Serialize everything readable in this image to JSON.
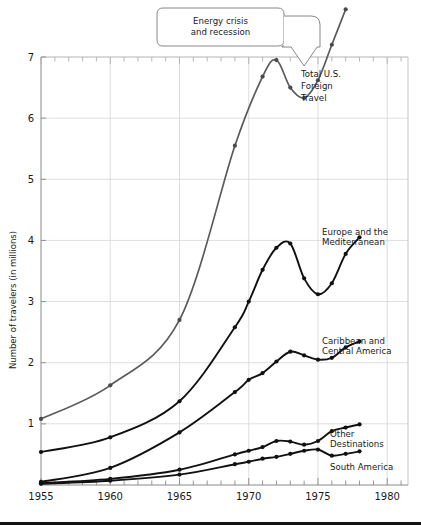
{
  "chart_data": {
    "type": "line",
    "title": "",
    "xlabel": "",
    "ylabel": "Number of travelers (in millions)",
    "xlim": [
      1955,
      1981.5
    ],
    "ylim": [
      0,
      7.85
    ],
    "grid": true,
    "legend_position": "right-inline-labels",
    "x_ticks_major": [
      1955,
      1960,
      1965,
      1970,
      1975,
      1980
    ],
    "x_tick_labels": [
      "1955",
      "1960",
      "1965",
      "1970",
      "1975",
      "1980"
    ],
    "x_minor_tick_step": 1,
    "y_ticks_major": [
      1,
      2,
      3,
      4,
      5,
      6,
      7
    ],
    "y_tick_labels": [
      "1",
      "2",
      "3",
      "4",
      "5",
      "6",
      "7"
    ],
    "annotations": [
      {
        "name": "energy-crisis-callout",
        "text_line1": "Energy crisis",
        "text_line2": "and recession",
        "points_to_year": 1974,
        "points_to_value": 6.85
      }
    ],
    "series": [
      {
        "name": "Total U.S. Foreign Travel",
        "label_line1": "Total U.S.",
        "label_line2": "Foreign",
        "label_line3": "Travel",
        "color": "#5a5a5a",
        "marker_color": "#4a4a4a",
        "points": [
          {
            "x": 1955,
            "y": 1.08
          },
          {
            "x": 1960,
            "y": 1.63
          },
          {
            "x": 1965,
            "y": 2.7
          },
          {
            "x": 1969,
            "y": 5.55
          },
          {
            "x": 1971,
            "y": 6.68
          },
          {
            "x": 1972,
            "y": 6.95
          },
          {
            "x": 1973,
            "y": 6.5
          },
          {
            "x": 1974,
            "y": 6.33
          },
          {
            "x": 1975,
            "y": 6.62
          },
          {
            "x": 1976,
            "y": 7.2
          },
          {
            "x": 1977,
            "y": 7.78
          }
        ]
      },
      {
        "name": "Europe and the Mediterranean",
        "label_line1": "Europe and the",
        "label_line2": "Mediterranean",
        "color": "#111111",
        "marker_color": "#111111",
        "points": [
          {
            "x": 1955,
            "y": 0.54
          },
          {
            "x": 1960,
            "y": 0.78
          },
          {
            "x": 1965,
            "y": 1.37
          },
          {
            "x": 1969,
            "y": 2.58
          },
          {
            "x": 1970,
            "y": 3.0
          },
          {
            "x": 1971,
            "y": 3.52
          },
          {
            "x": 1972,
            "y": 3.88
          },
          {
            "x": 1973,
            "y": 3.95
          },
          {
            "x": 1974,
            "y": 3.38
          },
          {
            "x": 1975,
            "y": 3.12
          },
          {
            "x": 1976,
            "y": 3.3
          },
          {
            "x": 1977,
            "y": 3.78
          },
          {
            "x": 1978,
            "y": 4.05
          }
        ]
      },
      {
        "name": "Caribbean and Central America",
        "label_line1": "Caribbean and",
        "label_line2": "Central America",
        "color": "#111111",
        "marker_color": "#111111",
        "points": [
          {
            "x": 1955,
            "y": 0.05
          },
          {
            "x": 1960,
            "y": 0.28
          },
          {
            "x": 1965,
            "y": 0.86
          },
          {
            "x": 1969,
            "y": 1.52
          },
          {
            "x": 1970,
            "y": 1.72
          },
          {
            "x": 1971,
            "y": 1.83
          },
          {
            "x": 1972,
            "y": 2.02
          },
          {
            "x": 1973,
            "y": 2.18
          },
          {
            "x": 1974,
            "y": 2.12
          },
          {
            "x": 1975,
            "y": 2.05
          },
          {
            "x": 1976,
            "y": 2.08
          },
          {
            "x": 1977,
            "y": 2.25
          },
          {
            "x": 1978,
            "y": 2.35
          }
        ]
      },
      {
        "name": "Other Destinations",
        "label_line1": "Other",
        "label_line2": "Destinations",
        "color": "#111111",
        "marker_color": "#111111",
        "points": [
          {
            "x": 1955,
            "y": 0.03
          },
          {
            "x": 1960,
            "y": 0.1
          },
          {
            "x": 1965,
            "y": 0.25
          },
          {
            "x": 1969,
            "y": 0.5
          },
          {
            "x": 1970,
            "y": 0.56
          },
          {
            "x": 1971,
            "y": 0.62
          },
          {
            "x": 1972,
            "y": 0.72
          },
          {
            "x": 1973,
            "y": 0.71
          },
          {
            "x": 1974,
            "y": 0.66
          },
          {
            "x": 1975,
            "y": 0.72
          },
          {
            "x": 1976,
            "y": 0.88
          },
          {
            "x": 1977,
            "y": 0.94
          },
          {
            "x": 1978,
            "y": 0.99
          }
        ]
      },
      {
        "name": "South America",
        "label_line1": "South America",
        "color": "#111111",
        "marker_color": "#111111",
        "points": [
          {
            "x": 1955,
            "y": 0.02
          },
          {
            "x": 1960,
            "y": 0.07
          },
          {
            "x": 1965,
            "y": 0.17
          },
          {
            "x": 1969,
            "y": 0.34
          },
          {
            "x": 1970,
            "y": 0.38
          },
          {
            "x": 1971,
            "y": 0.43
          },
          {
            "x": 1972,
            "y": 0.46
          },
          {
            "x": 1973,
            "y": 0.51
          },
          {
            "x": 1974,
            "y": 0.56
          },
          {
            "x": 1975,
            "y": 0.58
          },
          {
            "x": 1976,
            "y": 0.48
          },
          {
            "x": 1977,
            "y": 0.51
          },
          {
            "x": 1978,
            "y": 0.55
          }
        ]
      }
    ]
  }
}
